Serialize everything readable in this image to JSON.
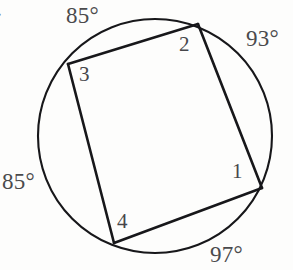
{
  "figure": {
    "type": "geometry-diagram",
    "item_tag": ".",
    "circle": {
      "center_x": 155,
      "center_y": 136,
      "radius": 117,
      "stroke": "#17171a"
    },
    "vertices": [
      {
        "id": "1",
        "label": "1",
        "x": 262,
        "y": 188
      },
      {
        "id": "2",
        "label": "2",
        "x": 198,
        "y": 24
      },
      {
        "id": "3",
        "label": "3",
        "x": 68,
        "y": 64
      },
      {
        "id": "4",
        "label": "4",
        "x": 114,
        "y": 243
      }
    ],
    "chords": [
      {
        "from": "3",
        "to": "2"
      },
      {
        "from": "2",
        "to": "1"
      },
      {
        "from": "1",
        "to": "4"
      },
      {
        "from": "4",
        "to": "3"
      }
    ],
    "arc_labels": [
      {
        "id": "arc-top",
        "text": "85°",
        "position": "top",
        "between": [
          "3",
          "2"
        ]
      },
      {
        "id": "arc-right",
        "text": "93°",
        "position": "right",
        "between": [
          "2",
          "1"
        ]
      },
      {
        "id": "arc-bottom",
        "text": "97°",
        "position": "bottom",
        "between": [
          "1",
          "4"
        ]
      },
      {
        "id": "arc-left",
        "text": "85°",
        "position": "left",
        "between": [
          "4",
          "3"
        ]
      }
    ]
  },
  "chart_data": {
    "type": "diagram",
    "title": "",
    "subtitle": "",
    "categories": [
      "arc 3-2",
      "arc 2-1",
      "arc 1-4",
      "arc 4-3"
    ],
    "values": [
      85,
      93,
      97,
      85
    ],
    "value_labels": [
      "85°",
      "93°",
      "97°",
      "85°"
    ],
    "point_labels": [
      "1",
      "2",
      "3",
      "4"
    ],
    "xlabel": "",
    "ylabel": "",
    "annotations": [
      "85°",
      "93°",
      "85°",
      "97°",
      "1",
      "2",
      "3",
      "4"
    ],
    "legend": [],
    "grid": false
  },
  "colors": {
    "ink": "#17171a",
    "text": "#4a4a4c",
    "background": "#fdfdfc"
  }
}
